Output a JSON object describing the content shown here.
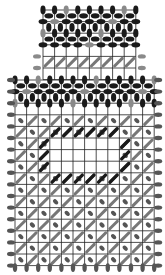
{
  "title": "",
  "colors": {
    "grid": "#222222",
    "dark_stitch": "#1a1a1a",
    "mid_stitch": "#555555",
    "light_stitch": "#8a8a8a",
    "hatch": "#777777",
    "background": "#ffffff"
  },
  "grid": {
    "cell": 11.6,
    "top_section": {
      "x0": 43,
      "y0": 10,
      "cols": 8,
      "rows": 6
    },
    "bottom_section": {
      "x0": 15,
      "y0": 80,
      "cols": 12,
      "rows": 16
    },
    "hatch_band_row": 4,
    "center_open": {
      "col0": 3,
      "row0": 5,
      "cols": 6,
      "rows": 3
    }
  },
  "legend": []
}
